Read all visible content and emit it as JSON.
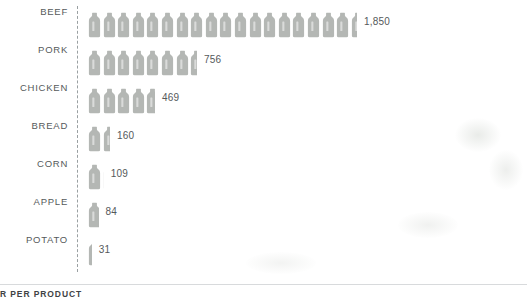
{
  "caption": "R PER PRODUCT",
  "axis": {
    "style": "dashed-vertical"
  },
  "icon": {
    "name": "bottle-icon",
    "color": "#b4b7b4",
    "unit_value": 100
  },
  "chart_data": {
    "type": "bar",
    "subtype": "pictogram",
    "title": "",
    "subtitle": "",
    "xlabel": "",
    "ylabel": "",
    "categories": [
      "BEEF",
      "PORK",
      "CHICKEN",
      "BREAD",
      "CORN",
      "APPLE",
      "POTATO"
    ],
    "values": [
      1850,
      756,
      469,
      160,
      109,
      84,
      31
    ],
    "value_labels": [
      "1,850",
      "756",
      "469",
      "160",
      "109",
      "84",
      "31"
    ],
    "unit_per_icon": 100,
    "icons": [
      18.5,
      7.56,
      4.69,
      1.6,
      1.09,
      0.84,
      0.31
    ],
    "grid": false,
    "legend": "none",
    "orientation": "horizontal",
    "xlim": [
      0,
      1850
    ]
  },
  "rows": [
    {
      "label": "BEEF",
      "value_label": "1,850",
      "value": 1850,
      "icons": 18.5
    },
    {
      "label": "PORK",
      "value_label": "756",
      "value": 756,
      "icons": 7.56
    },
    {
      "label": "CHICKEN",
      "value_label": "469",
      "value": 469,
      "icons": 4.69
    },
    {
      "label": "BREAD",
      "value_label": "160",
      "value": 160,
      "icons": 1.6
    },
    {
      "label": "CORN",
      "value_label": "109",
      "value": 109,
      "icons": 1.09
    },
    {
      "label": "APPLE",
      "value_label": "84",
      "value": 84,
      "icons": 0.84
    },
    {
      "label": "POTATO",
      "value_label": "31",
      "value": 31,
      "icons": 0.31
    }
  ]
}
